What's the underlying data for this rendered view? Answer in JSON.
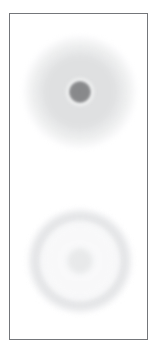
{
  "figure": {
    "title": "Concentric intensity blobs panel",
    "background_color": "#ffffff",
    "border_color": "#74767a",
    "border_width_px": 1,
    "frame": {
      "x": 9,
      "y": 13,
      "width": 139,
      "height": 327
    },
    "canvas": {
      "width": 157,
      "height": 347
    }
  },
  "chart_data": {
    "type": "heatmap",
    "title": "Concentric intensity blobs panel",
    "subtitle": "",
    "xlabel": "",
    "ylabel": "",
    "grid": false,
    "legend": "none",
    "axis_ticks": [],
    "tick_labels": [],
    "annotations": [],
    "xlim": [
      0,
      139
    ],
    "ylim": [
      0,
      327
    ],
    "objects": [
      {
        "name": "top-blob",
        "shape": "concentric-disc",
        "center": {
          "x": 70,
          "y": 78
        },
        "rings": [
          {
            "name": "outer-halo",
            "radius": 58,
            "color": "#e4e5e6",
            "opacity": 1.0,
            "blur": 2.2
          },
          {
            "name": "mid-disc",
            "radius": 43,
            "color": "#dfe0e1",
            "opacity": 1.0,
            "blur": 2.0
          },
          {
            "name": "inner-ring",
            "radius": 15,
            "color": "#f0f1f1",
            "opacity": 1.0,
            "blur": 1.6
          },
          {
            "name": "core",
            "radius": 11.5,
            "color": "#87888a",
            "opacity": 1.0,
            "blur": 1.1
          }
        ]
      },
      {
        "name": "bottom-blob",
        "shape": "concentric-annulus",
        "center": {
          "x": 70,
          "y": 247
        },
        "rings": [
          {
            "name": "outer-halo",
            "radius": 56,
            "color": "#f9f9fa",
            "opacity": 1.0,
            "blur": 2.0
          },
          {
            "name": "annulus-band",
            "radius": 52,
            "inner_radius": 39,
            "color": "#e4e5e7",
            "opacity": 0.95,
            "blur": 2.4
          },
          {
            "name": "interior",
            "radius": 39,
            "color": "#fafafb",
            "opacity": 1.0,
            "blur": 2.0
          },
          {
            "name": "core",
            "radius": 15,
            "color": "#e8e9ea",
            "opacity": 1.0,
            "blur": 2.2
          }
        ]
      }
    ],
    "colors": {
      "background": "#ffffff",
      "frame_border": "#74767a",
      "top_core": "#87888a",
      "top_mid_disc": "#dfe0e1",
      "top_halo": "#e4e5e6",
      "top_inner_ring": "#f0f1f1",
      "bottom_ring": "#e4e5e7",
      "bottom_interior": "#fafafb",
      "bottom_core": "#e8e9ea"
    }
  }
}
